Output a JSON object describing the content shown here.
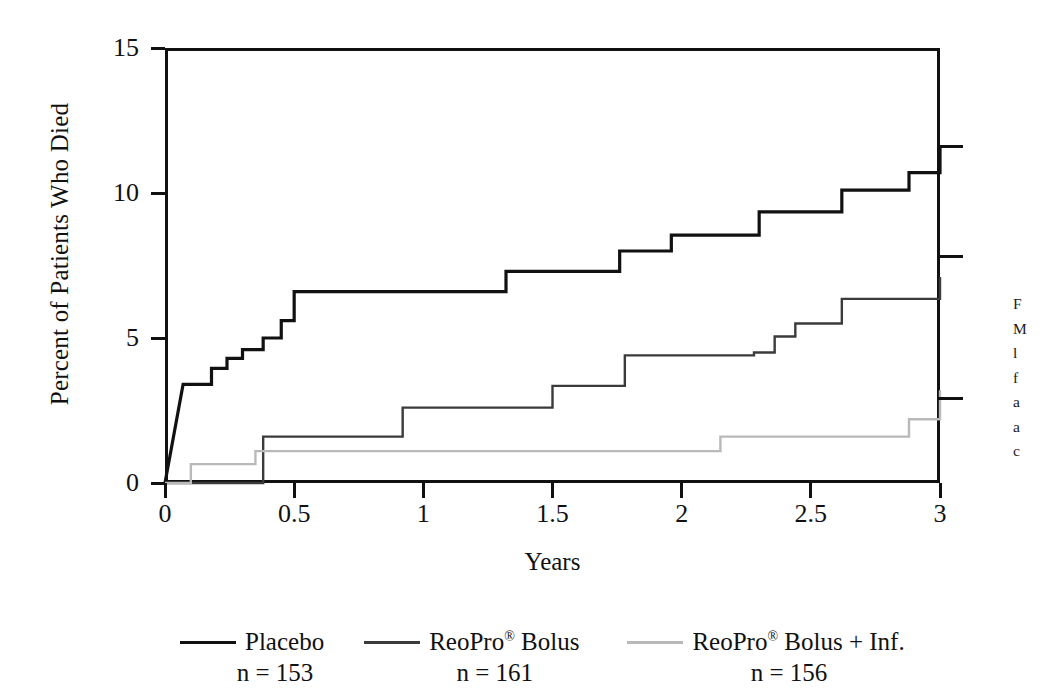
{
  "chart_data": {
    "type": "line",
    "subtype": "kaplan-meier-step",
    "title": "",
    "xlabel": "Years",
    "ylabel": "Percent of Patients Who Died",
    "xlim": [
      0,
      3
    ],
    "ylim": [
      0,
      15
    ],
    "xticks": [
      "0",
      "0.5",
      "1",
      "1.5",
      "2",
      "2.5",
      "3"
    ],
    "xtick_values": [
      0,
      0.5,
      1,
      1.5,
      2,
      2.5,
      3
    ],
    "yticks": [
      "0",
      "5",
      "10",
      "15"
    ],
    "ytick_values": [
      0,
      5,
      10,
      15
    ],
    "grid": false,
    "legend_position": "below",
    "series": [
      {
        "name": "Placebo",
        "n_label": "n = 153",
        "n": 153,
        "color": "#111111",
        "stroke_width": 3.2,
        "end_value": 11.6,
        "end_label": "11,6",
        "x": [
          0.0,
          0.07,
          0.13,
          0.18,
          0.24,
          0.3,
          0.38,
          0.45,
          0.5,
          1.3,
          1.32,
          1.74,
          1.76,
          1.96,
          2.22,
          2.3,
          2.44,
          2.62,
          2.88,
          3.0
        ],
        "y": [
          0.0,
          3.4,
          3.4,
          3.95,
          4.3,
          4.6,
          5.0,
          5.6,
          6.6,
          6.6,
          7.3,
          7.3,
          8.0,
          8.55,
          8.55,
          9.35,
          9.35,
          10.1,
          10.7,
          11.6
        ]
      },
      {
        "name": "ReoPro® Bolus",
        "n_label": "n = 161",
        "n": 161,
        "color": "#3b3b3b",
        "stroke_width": 2.4,
        "end_value": 7.8,
        "end_label": "7,8",
        "x": [
          0.0,
          0.38,
          0.78,
          0.92,
          1.3,
          1.44,
          1.5,
          1.72,
          1.78,
          2.1,
          2.28,
          2.36,
          2.44,
          2.54,
          2.62,
          2.9,
          3.0
        ],
        "y": [
          0.0,
          1.6,
          1.6,
          2.6,
          2.6,
          2.6,
          3.35,
          3.35,
          4.4,
          4.4,
          4.5,
          5.05,
          5.5,
          5.5,
          6.35,
          6.35,
          7.1
        ]
      },
      {
        "name": "ReoPro® Bolus + Inf.",
        "n_label": "n = 156",
        "n": 156,
        "color": "#b9b9b9",
        "stroke_width": 2.4,
        "end_value": 2.9,
        "end_label": "2,9",
        "x": [
          0.0,
          0.1,
          0.35,
          1.48,
          2.15,
          2.88,
          3.0
        ],
        "y": [
          0.0,
          0.65,
          1.1,
          1.1,
          1.6,
          2.2,
          3.2
        ]
      }
    ],
    "end_annotations": [
      {
        "label": "11,6",
        "value": 11.6
      },
      {
        "label": "7,8",
        "value": 7.8
      },
      {
        "label": "2,9",
        "value": 2.9
      }
    ]
  },
  "axes": {
    "y_title": "Percent of Patients Who Died",
    "x_title": "Years",
    "y_tick_labels": [
      "15",
      "10",
      "5",
      "0"
    ],
    "y_tick_positions": [
      15,
      10,
      5,
      0
    ],
    "x_tick_labels": [
      "0",
      "0.5",
      "1",
      "1.5",
      "2",
      "2.5",
      "3"
    ],
    "x_tick_positions": [
      0,
      0.5,
      1,
      1.5,
      2,
      2.5,
      3
    ]
  },
  "legend": {
    "entries": [
      {
        "label": "Placebo",
        "reg_mark": "",
        "suffix": "",
        "n_label": "n = 153",
        "swatch_color": "#111111",
        "swatch_height": 3.5
      },
      {
        "label": "ReoPro",
        "reg_mark": "®",
        "suffix": " Bolus",
        "n_label": "n = 161",
        "swatch_color": "#3b3b3b",
        "swatch_height": 3.5
      },
      {
        "label": "ReoPro",
        "reg_mark": "®",
        "suffix": " Bolus + Inf.",
        "n_label": "n = 156",
        "swatch_color": "#b9b9b9",
        "swatch_height": 3.5
      }
    ]
  },
  "caption": {
    "clipped": true,
    "lines": [
      "F",
      "M",
      "l",
      "f",
      "a",
      "a",
      "c"
    ]
  },
  "colors": {
    "background": "#ffffff",
    "axis": "#111111",
    "placebo": "#111111",
    "bolus": "#3b3b3b",
    "bolus_inf": "#b9b9b9"
  }
}
